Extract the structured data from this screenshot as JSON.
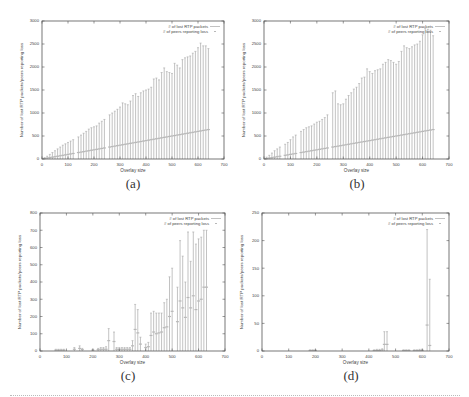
{
  "figure": {
    "panels": [
      {
        "label": "(a)"
      },
      {
        "label": "(b)"
      },
      {
        "label": "(c)"
      },
      {
        "label": "(d)"
      }
    ]
  },
  "chart_data": [
    {
      "id": "a",
      "type": "errorbar",
      "title": "",
      "xlabel": "Overlay size",
      "ylabel": "Number of lost RTP packets/peers reporting loss",
      "xlim": [
        0,
        700
      ],
      "ylim": [
        0,
        3000
      ],
      "xticks": [
        0,
        100,
        200,
        300,
        400,
        500,
        600,
        700
      ],
      "yticks": [
        0,
        500,
        1000,
        1500,
        2000,
        2500,
        3000
      ],
      "grid": false,
      "legend": {
        "position": "top-right",
        "entries": [
          "# of lost RTP packets",
          "# of peers reporting loss"
        ]
      },
      "x": [
        10,
        20,
        30,
        40,
        50,
        60,
        70,
        80,
        90,
        100,
        110,
        120,
        140,
        150,
        160,
        170,
        180,
        190,
        200,
        210,
        220,
        230,
        240,
        260,
        270,
        280,
        290,
        300,
        310,
        320,
        330,
        340,
        350,
        360,
        370,
        380,
        390,
        400,
        410,
        420,
        430,
        440,
        450,
        460,
        470,
        480,
        490,
        500,
        510,
        520,
        530,
        540,
        550,
        560,
        570,
        580,
        590,
        600,
        610,
        620,
        630,
        640
      ],
      "series": [
        {
          "name": "# of lost RTP packets",
          "values": [
            30,
            60,
            100,
            140,
            180,
            220,
            260,
            300,
            330,
            360,
            390,
            420,
            480,
            520,
            560,
            600,
            650,
            680,
            700,
            720,
            780,
            820,
            860,
            960,
            1000,
            1040,
            1080,
            1130,
            1220,
            1200,
            1180,
            1260,
            1380,
            1420,
            1360,
            1440,
            1480,
            1500,
            1520,
            1560,
            1740,
            1760,
            1720,
            1880,
            1980,
            1900,
            1880,
            1860,
            2080,
            2040,
            1980,
            2160,
            2200,
            2220,
            2240,
            2300,
            2340,
            2420,
            2520,
            2460,
            2460,
            2400
          ]
        },
        {
          "name": "# of peers reporting loss",
          "values": [
            10,
            20,
            30,
            40,
            50,
            60,
            70,
            80,
            90,
            100,
            110,
            120,
            140,
            150,
            160,
            170,
            180,
            190,
            200,
            210,
            220,
            230,
            240,
            260,
            270,
            280,
            290,
            300,
            310,
            320,
            330,
            340,
            350,
            360,
            370,
            380,
            390,
            400,
            410,
            420,
            430,
            440,
            450,
            460,
            470,
            480,
            490,
            500,
            510,
            520,
            530,
            540,
            550,
            560,
            570,
            580,
            590,
            600,
            610,
            620,
            630,
            640
          ]
        }
      ]
    },
    {
      "id": "b",
      "type": "errorbar",
      "title": "",
      "xlabel": "Overlay size",
      "ylabel": "Number of lost RTP packets/peers reporting loss",
      "xlim": [
        0,
        700
      ],
      "ylim": [
        0,
        3000
      ],
      "xticks": [
        0,
        100,
        200,
        300,
        400,
        500,
        600,
        700
      ],
      "yticks": [
        0,
        500,
        1000,
        1500,
        2000,
        2500,
        3000
      ],
      "grid": false,
      "legend": {
        "position": "top-right",
        "entries": [
          "# of lost RTP packets",
          "# of peers reporting loss"
        ]
      },
      "x": [
        10,
        20,
        30,
        40,
        50,
        60,
        80,
        90,
        100,
        110,
        120,
        140,
        150,
        160,
        170,
        180,
        190,
        200,
        210,
        220,
        230,
        240,
        260,
        270,
        280,
        290,
        300,
        310,
        320,
        330,
        340,
        350,
        360,
        370,
        380,
        390,
        400,
        410,
        420,
        430,
        440,
        450,
        460,
        470,
        480,
        490,
        500,
        510,
        520,
        530,
        540,
        550,
        560,
        570,
        580,
        590,
        600,
        610,
        620,
        630,
        640
      ],
      "series": [
        {
          "name": "# of lost RTP packets",
          "values": [
            40,
            80,
            130,
            180,
            220,
            260,
            320,
            360,
            420,
            480,
            520,
            600,
            640,
            680,
            700,
            720,
            760,
            800,
            820,
            860,
            900,
            960,
            1440,
            1480,
            1200,
            1180,
            1200,
            1300,
            1380,
            1440,
            1520,
            1560,
            1640,
            1760,
            1780,
            1960,
            1900,
            1860,
            1920,
            1940,
            1960,
            2060,
            2100,
            2160,
            2140,
            2100,
            2060,
            2120,
            2340,
            2460,
            2420,
            2400,
            2440,
            2480,
            2500,
            2560,
            2700,
            2840,
            2820,
            2800,
            2680
          ]
        },
        {
          "name": "# of peers reporting loss",
          "values": [
            10,
            20,
            30,
            40,
            50,
            60,
            80,
            90,
            100,
            110,
            120,
            140,
            150,
            160,
            170,
            180,
            190,
            200,
            210,
            220,
            230,
            240,
            260,
            270,
            280,
            290,
            300,
            310,
            320,
            330,
            340,
            350,
            360,
            370,
            380,
            390,
            400,
            410,
            420,
            430,
            440,
            450,
            460,
            470,
            480,
            490,
            500,
            510,
            520,
            530,
            540,
            550,
            560,
            570,
            580,
            590,
            600,
            610,
            620,
            630,
            640
          ]
        }
      ]
    },
    {
      "id": "c",
      "type": "errorbar",
      "title": "",
      "xlabel": "Overlay size",
      "ylabel": "Number of lost RTP packets/peers reporting loss",
      "xlim": [
        0,
        700
      ],
      "ylim": [
        0,
        800
      ],
      "xticks": [
        0,
        100,
        200,
        300,
        400,
        500,
        600,
        700
      ],
      "yticks": [
        0,
        100,
        200,
        300,
        400,
        500,
        600,
        700,
        800
      ],
      "grid": false,
      "legend": {
        "position": "top-right",
        "entries": [
          "# of lost RTP packets",
          "# of peers reporting loss"
        ]
      },
      "x": [
        60,
        70,
        80,
        90,
        130,
        150,
        160,
        200,
        220,
        230,
        240,
        250,
        260,
        280,
        290,
        300,
        310,
        320,
        330,
        340,
        350,
        360,
        370,
        380,
        400,
        410,
        420,
        430,
        440,
        450,
        460,
        470,
        480,
        490,
        500,
        520,
        530,
        540,
        550,
        560,
        570,
        580,
        590,
        600,
        610,
        620,
        630
      ],
      "series": [
        {
          "name": "# of lost RTP packets",
          "values": [
            10,
            10,
            10,
            10,
            20,
            30,
            15,
            10,
            15,
            20,
            20,
            25,
            130,
            110,
            20,
            20,
            20,
            20,
            20,
            20,
            60,
            270,
            240,
            80,
            40,
            50,
            220,
            230,
            220,
            220,
            220,
            280,
            300,
            430,
            480,
            370,
            640,
            550,
            400,
            690,
            520,
            690,
            620,
            650,
            660,
            700,
            700
          ]
        },
        {
          "name": "# of peers reporting loss",
          "values": [
            5,
            5,
            5,
            5,
            10,
            15,
            8,
            5,
            8,
            10,
            10,
            10,
            60,
            55,
            10,
            10,
            10,
            10,
            10,
            10,
            30,
            125,
            105,
            40,
            20,
            25,
            90,
            110,
            100,
            105,
            110,
            135,
            140,
            200,
            230,
            170,
            290,
            250,
            195,
            310,
            250,
            320,
            240,
            290,
            300,
            370,
            370
          ]
        }
      ]
    },
    {
      "id": "d",
      "type": "errorbar",
      "title": "",
      "xlabel": "Overlay size",
      "ylabel": "Number of lost RTP packets/peers reporting loss",
      "xlim": [
        0,
        700
      ],
      "ylim": [
        0,
        250
      ],
      "xticks": [
        0,
        100,
        200,
        300,
        400,
        500,
        600,
        700
      ],
      "yticks": [
        0,
        50,
        100,
        150,
        200,
        250
      ],
      "grid": false,
      "legend": {
        "position": "top-right",
        "entries": [
          "# of lost RTP packets",
          "# of peers reporting loss"
        ]
      },
      "x": [
        180,
        190,
        200,
        420,
        430,
        440,
        450,
        458,
        468,
        530,
        540,
        550,
        570,
        580,
        590,
        600,
        618,
        628
      ],
      "series": [
        {
          "name": "# of lost RTP packets",
          "values": [
            2,
            2,
            2,
            2,
            3,
            3,
            4,
            35,
            35,
            2,
            2,
            2,
            2,
            2,
            3,
            3,
            220,
            130
          ]
        },
        {
          "name": "# of peers reporting loss",
          "values": [
            1,
            1,
            1,
            1,
            1,
            1,
            2,
            12,
            12,
            1,
            1,
            1,
            1,
            1,
            1,
            1,
            47,
            10
          ]
        }
      ]
    }
  ]
}
